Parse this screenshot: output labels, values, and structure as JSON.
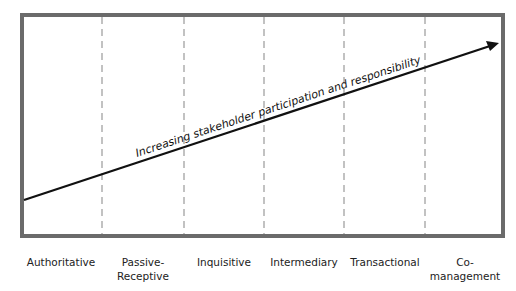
{
  "diagram": {
    "arrow_label": "Increasing stakeholder participation and responsibility",
    "colors": {
      "frame": "#6b6b6b",
      "dash": "#9a9a9a",
      "arrow": "#111111"
    },
    "categories": [
      {
        "label": "Authoritative"
      },
      {
        "label": "Passive-\nReceptive"
      },
      {
        "label": "Inquisitive"
      },
      {
        "label": "Intermediary"
      },
      {
        "label": "Transactional"
      },
      {
        "label": "Co-\nmanagement"
      }
    ]
  }
}
